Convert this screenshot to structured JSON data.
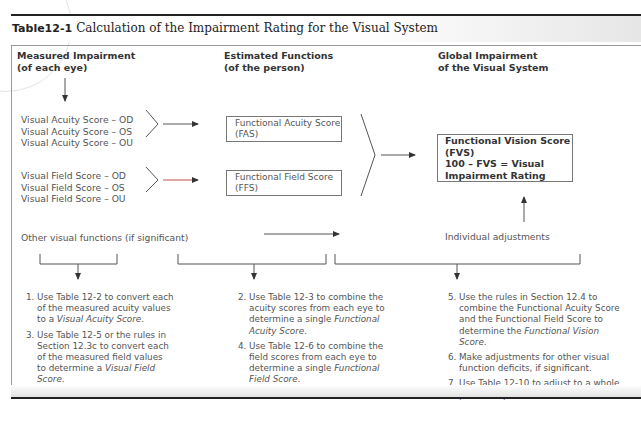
{
  "title": {
    "number": "Table12-1",
    "text": "Calculation of the Impairment Rating for the Visual System"
  },
  "columns": [
    {
      "line1": "Measured Impairment",
      "line2": "(of each eye)"
    },
    {
      "line1": "Estimated Functions",
      "line2": "(of the person)"
    },
    {
      "line1": "Global Impairment",
      "line2": "of the Visual System"
    }
  ],
  "acuity_scores": [
    "Visual Acuity Score – OD",
    "Visual Acuity Score – OS",
    "Visual Acuity Score – OU"
  ],
  "field_scores": [
    "Visual Field Score – OD",
    "Visual Field Score – OS",
    "Visual Field Score – OU"
  ],
  "fas_box": {
    "line1": "Functional Acuity Score",
    "line2": "(FAS)"
  },
  "ffs_box": {
    "line1": "Functional Field Score",
    "line2": "(FFS)"
  },
  "fvs_box": {
    "line1": "Functional Vision Score",
    "line2": "(FVS)",
    "line3": "100 – FVS = Visual",
    "line4": "Impairment Rating"
  },
  "other_functions": "Other visual functions (if significant)",
  "individual_adjustments": "Individual adjustments",
  "steps": {
    "col1": [
      {
        "num": "1.",
        "pre": "Use Table 12-2 to convert each of the measured acuity values to a ",
        "em": "Visual Acuity Score",
        "post": "."
      },
      {
        "num": "3.",
        "pre": "Use Table 12-5 or the rules in Section 12.3c to convert each of the measured field values to determine a ",
        "em": "Visual Field Score",
        "post": "."
      }
    ],
    "col2": [
      {
        "num": "2.",
        "pre": "Use Table 12-3 to combine the acuity scores from each eye to determine a single ",
        "em": "Functional Acuity Score",
        "post": "."
      },
      {
        "num": "4.",
        "pre": "Use Table 12-6 to combine the field scores from each eye to determine a single ",
        "em": "Functional Field Score",
        "post": "."
      }
    ],
    "col3": [
      {
        "num": "5.",
        "pre": "Use the rules in Section 12.4 to combine the Functional Acuity Score and the Functional Field Score to determine the ",
        "em": "Functional Vision Score",
        "post": "."
      },
      {
        "num": "6.",
        "pre": "Make adjustments for other visual function deficits, if significant.",
        "em": "",
        "post": ""
      },
      {
        "num": "7.",
        "pre": "Use Table 12-10 to adjust to a whole person impairment.",
        "em": "",
        "post": ""
      }
    ]
  },
  "colors": {
    "line": "#555555",
    "accent_arrow": "#c0504d",
    "rule": "#222222"
  }
}
